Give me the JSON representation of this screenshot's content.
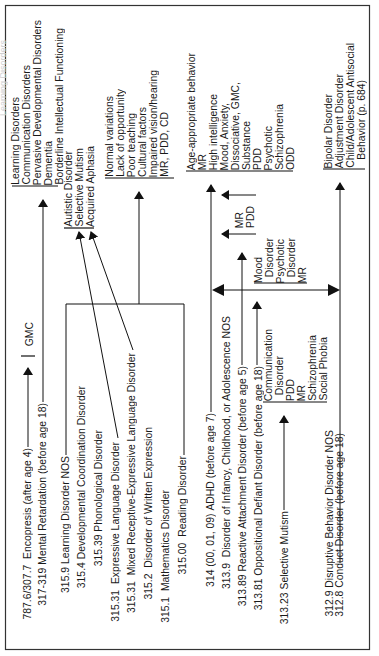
{
  "diagram": {
    "orientation": "rotated-90-ccw",
    "ghost_text": "Learning Disorders",
    "sources": [
      {
        "id": "encopresis",
        "code": "787.6/307.7",
        "label": "Encopresis (after age 4)"
      },
      {
        "id": "mental-retardation",
        "code": "317-319",
        "label": "Mental Retardation (before age 18)"
      },
      {
        "id": "learning-nos",
        "code": "315.9",
        "label": "Learning Disorder NOS"
      },
      {
        "id": "developmental-coordination",
        "code": "315.4",
        "label": "Developmental Coordination Disorder"
      },
      {
        "id": "phonological",
        "code": "315.39",
        "label": "Phonological Disorder"
      },
      {
        "id": "expressive-language",
        "code": "315.31",
        "label": "Expressive Language Disorder"
      },
      {
        "id": "mixed-receptive-expressive",
        "code": "315.31",
        "label": "Mixed Receptive-Expressive Language Disorder"
      },
      {
        "id": "written-expression",
        "code": "315.2",
        "label": "Disorder of Written Expression"
      },
      {
        "id": "mathematics",
        "code": "315.1",
        "label": "Mathematics Disorder"
      },
      {
        "id": "reading",
        "code": "315.00",
        "label": "Reading Disorder"
      },
      {
        "id": "adhd",
        "code": "314 (00, 01, 09)",
        "label": "ADHD (before age 7)"
      },
      {
        "id": "infancy-nos",
        "code": "313.9",
        "label": "Disorder of Infancy, Childhood, or Adolescence NOS"
      },
      {
        "id": "reactive-attachment",
        "code": "313.89",
        "label": "Reactive Attachment Disorder (before age 5)"
      },
      {
        "id": "oppositional-defiant",
        "code": "313.81",
        "label": "Oppositional Defiant Disorder (before age 18)"
      },
      {
        "id": "selective-mutism",
        "code": "313.23",
        "label": "Selective Mutism"
      },
      {
        "id": "disruptive-nos",
        "code": "312.9",
        "label": "Disruptive Behavior Disorder NOS"
      },
      {
        "id": "conduct",
        "code": "312.8",
        "label": "Conduct Disorder (before age 18)"
      }
    ],
    "targets": {
      "gmc": [
        "GMC"
      ],
      "mr_group": [
        "Learning Disorders",
        "Communication Disorders",
        "Pervasive Developmental Disorders",
        "Dementia",
        "Borderline Intellectual Functioning"
      ],
      "language_group": [
        "Autistic Disorder",
        "Selective Mutism",
        "Acquired Aphasia"
      ],
      "learning_group": [
        "Normal variations",
        "Lack of opportunity",
        "Poor teaching",
        "Cultural factors",
        "Impaired vision/hearing",
        "MR, PDD, CD"
      ],
      "adhd_group": [
        "Age-appropriate behavior",
        "MR",
        "High intelligence",
        "Mood, Anxiety,",
        "Dissociative, GMC,",
        "Substance",
        "PDD",
        "Psychotic",
        "Schizophrenia",
        "ODD"
      ],
      "attachment_group": [
        "MR",
        "PDD"
      ],
      "odd_group": [
        "Mood",
        "  Disorder",
        "Psychotic",
        "  Disorder",
        "MR"
      ],
      "mutism_group": [
        "Communication",
        "  Disorder",
        "PDD",
        "MR",
        "Schizophrenia",
        "Social Phobia"
      ],
      "conduct_group": [
        "Bipolar Disorder",
        "Adjustment Disorder",
        "Child/Adolescent Antisocial",
        "   Behavior (p. 684)"
      ]
    }
  }
}
